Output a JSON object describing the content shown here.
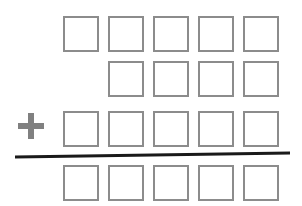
{
  "worksheet": {
    "type": "vertical-addition-blank-boxes",
    "operator_symbol": "+",
    "accent_color": "#808080",
    "box_border_color": "#8c8c8c",
    "rule_color": "#1a1a1a",
    "background_color": "#ffffff",
    "canvas": {
      "width": 302,
      "height": 206
    },
    "geometry": {
      "box_width": 36,
      "box_height": 36,
      "column_pitch": 45,
      "first_column_x": 63,
      "columns": 5
    },
    "operand_rows": [
      {
        "name": "addend-row-1",
        "top": 16,
        "start_column": 1,
        "boxes": 5,
        "box_labels": [
          "",
          "",
          "",
          "",
          ""
        ]
      },
      {
        "name": "addend-row-2",
        "top": 61,
        "start_column": 2,
        "boxes": 4,
        "box_labels": [
          "",
          "",
          "",
          ""
        ]
      },
      {
        "name": "addend-row-3",
        "top": 111,
        "start_column": 1,
        "boxes": 5,
        "box_labels": [
          "",
          "",
          "",
          "",
          ""
        ]
      }
    ],
    "sum_row": {
      "name": "sum-row",
      "top": 165,
      "start_column": 1,
      "boxes": 5,
      "box_labels": [
        "",
        "",
        "",
        "",
        ""
      ]
    },
    "operator": {
      "label": "+",
      "left": 17,
      "top": 112,
      "size": 30
    },
    "rule": {
      "label": "addition-bar",
      "x1": 15,
      "y1": 157,
      "x2": 290,
      "y2": 153,
      "thickness": 3
    }
  }
}
